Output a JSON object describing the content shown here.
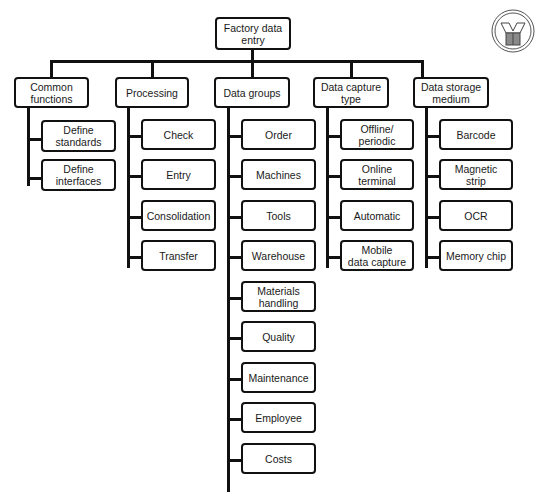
{
  "root": {
    "label": "Factory data\nentry"
  },
  "categories": [
    {
      "label": "Common\nfunctions",
      "children": [
        "Define\nstandards",
        "Define\ninterfaces"
      ]
    },
    {
      "label": "Processing",
      "children": [
        "Check",
        "Entry",
        "Consolidation",
        "Transfer"
      ]
    },
    {
      "label": "Data groups",
      "children": [
        "Order",
        "Machines",
        "Tools",
        "Warehouse",
        "Materials\nhandling",
        "Quality",
        "Maintenance",
        "Employee",
        "Costs"
      ]
    },
    {
      "label": "Data capture\ntype",
      "children": [
        "Offline/\nperiodic",
        "Online terminal",
        "Automatic",
        "Mobile\ndata capture"
      ]
    },
    {
      "label": "Data storage\nmedium",
      "children": [
        "Barcode",
        "Magnetic\nstrip",
        "OCR",
        "Memory chip"
      ]
    }
  ],
  "logo": {
    "icon": "company-logo-icon"
  },
  "colors": {
    "line": "#111111",
    "background": "#ffffff",
    "logo_fill": "#8a8a8a"
  }
}
